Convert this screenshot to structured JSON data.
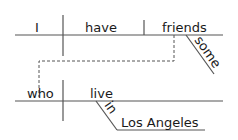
{
  "diagram": {
    "type": "sentence-diagram",
    "main_clause": {
      "subject": "I",
      "verb": "have",
      "object": "friends",
      "object_modifier": "some"
    },
    "relative_clause": {
      "subject": "who",
      "verb": "live",
      "preposition": "in",
      "prepositional_object": "Los Angeles"
    }
  }
}
